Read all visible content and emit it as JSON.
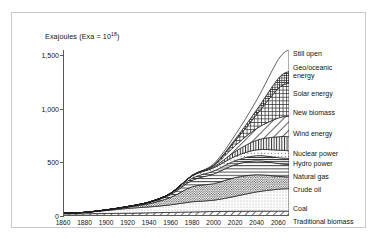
{
  "figure": {
    "axis_title": "Exajoules (Exa = 10",
    "axis_title_sup": "18",
    "axis_title_tail": ")"
  },
  "chart_data": {
    "type": "area",
    "xlabel": "",
    "ylabel": "Exajoules (Exa = 10^18)",
    "stacked": true,
    "grid": false,
    "legend_position": "right",
    "xlim": [
      1860,
      2070
    ],
    "ylim": [
      0,
      1550
    ],
    "yticks": [
      0,
      500,
      1000,
      1500
    ],
    "ytick_labels": [
      "0",
      "500",
      "1,000",
      "1,500"
    ],
    "xticks": [
      1860,
      1880,
      1900,
      1920,
      1940,
      1960,
      1980,
      2000,
      2020,
      2040,
      2060
    ],
    "xtick_labels": [
      "1860",
      "1880",
      "1900",
      "1920",
      "1940",
      "1960",
      "1980",
      "2000",
      "2020",
      "2040",
      "2060"
    ],
    "x": [
      1860,
      1880,
      1900,
      1920,
      1940,
      1960,
      1980,
      2000,
      2020,
      2040,
      2060,
      2070
    ],
    "series": [
      {
        "name": "Traditional biomass",
        "pattern": "diagonal-hatch",
        "values": [
          20,
          21,
          23,
          26,
          30,
          34,
          38,
          42,
          44,
          45,
          45,
          45
        ]
      },
      {
        "name": "Coal",
        "pattern": "light-stipple",
        "values": [
          5,
          12,
          28,
          45,
          55,
          70,
          95,
          105,
          140,
          180,
          205,
          210
        ]
      },
      {
        "name": "Crude oil",
        "pattern": "dense-stipple",
        "values": [
          0,
          1,
          4,
          12,
          30,
          70,
          140,
          155,
          175,
          160,
          120,
          110
        ]
      },
      {
        "name": "Natural gas",
        "pattern": "horizontal-lines",
        "values": [
          0,
          0,
          1,
          3,
          10,
          25,
          60,
          90,
          120,
          130,
          120,
          115
        ]
      },
      {
        "name": "Hydro power",
        "pattern": "horizontal-lines-fine",
        "values": [
          0,
          0,
          1,
          2,
          5,
          10,
          20,
          28,
          38,
          48,
          55,
          57
        ]
      },
      {
        "name": "Nuclear power",
        "pattern": "sparse-dots",
        "values": [
          0,
          0,
          0,
          0,
          0,
          3,
          22,
          30,
          40,
          55,
          70,
          72
        ]
      },
      {
        "name": "Wind energy",
        "pattern": "vertical-lines",
        "values": [
          0,
          0,
          0,
          0,
          0,
          0,
          1,
          8,
          45,
          90,
          125,
          132
        ]
      },
      {
        "name": "New biomass",
        "pattern": "diagonal-hatch-wide",
        "values": [
          0,
          0,
          0,
          0,
          0,
          0,
          2,
          12,
          55,
          110,
          175,
          190
        ]
      },
      {
        "name": "Solar energy",
        "pattern": "cross-hatch",
        "values": [
          0,
          0,
          0,
          0,
          0,
          0,
          0,
          5,
          45,
          130,
          275,
          310
        ]
      },
      {
        "name": "Geo/oceanic energy",
        "pattern": "dense-cross",
        "values": [
          0,
          0,
          0,
          0,
          0,
          0,
          0,
          2,
          15,
          45,
          95,
          110
        ]
      },
      {
        "name": "Still open",
        "pattern": "blank",
        "values": [
          0,
          0,
          0,
          0,
          0,
          0,
          2,
          10,
          40,
          90,
          175,
          205
        ]
      }
    ]
  },
  "legend": [
    {
      "label": "Still open",
      "top": 0
    },
    {
      "label": "Geo/oceanic energy",
      "top": 14
    },
    {
      "label": "Solar energy",
      "top": 40
    },
    {
      "label": "New biomass",
      "top": 59
    },
    {
      "label": "Wind energy",
      "top": 80
    },
    {
      "label": "Nuclear power",
      "top": 100
    },
    {
      "label": "Hydro power",
      "top": 110
    },
    {
      "label": "Natural gas",
      "top": 123
    },
    {
      "label": "Crude oil",
      "top": 136
    },
    {
      "label": "Coal",
      "top": 155
    },
    {
      "label": "Traditional biomass",
      "top": 168
    }
  ]
}
